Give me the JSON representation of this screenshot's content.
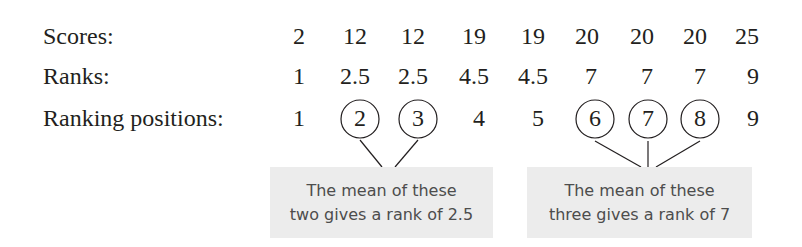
{
  "rows": [
    {
      "label": "Scores:",
      "values": [
        "2",
        "12",
        "12",
        "19",
        "19",
        "20",
        "20",
        "20",
        "25"
      ]
    },
    {
      "label": "Ranks:",
      "values": [
        "1",
        "2.5",
        "2.5",
        "4.5",
        "4.5",
        "7",
        "7",
        "7",
        "9"
      ]
    },
    {
      "label": "Ranking positions:",
      "values": [
        "1",
        "2",
        "3",
        "4",
        "5",
        "6",
        "7",
        "8",
        "9"
      ],
      "circled": [
        1,
        2,
        5,
        6,
        7
      ]
    }
  ],
  "notes": [
    {
      "line1": "The mean of these",
      "line2": "two gives a rank of 2.5"
    },
    {
      "line1": "The mean of these",
      "line2": "three gives a rank of 7"
    }
  ],
  "colors": {
    "text": "#231f20",
    "note_bg": "#ececec",
    "note_text": "#4d4d4d"
  }
}
